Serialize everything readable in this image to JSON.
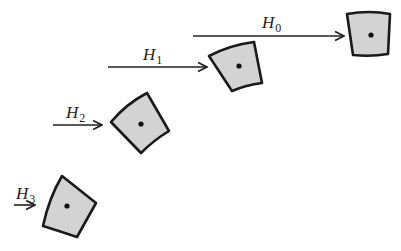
{
  "diagram": {
    "type": "sequence of rotating cells with field arrows",
    "colors": {
      "shape_fill": "#d3d3d3",
      "shape_stroke": "#1a1a1a",
      "arrow": "#222222",
      "background": "#ffffff"
    },
    "items": [
      {
        "label_main": "H",
        "label_sub": "0",
        "arrow": {
          "x1": 193,
          "x2": 344,
          "y": 36
        },
        "label_pos": {
          "x": 262,
          "y": 28
        },
        "shape_path": "M347,14 Q369,10 390,14 L388,54 Q371,57 353,55 Z",
        "center": {
          "x": 371,
          "y": 35
        }
      },
      {
        "label_main": "H",
        "label_sub": "1",
        "arrow": {
          "x1": 108,
          "x2": 207,
          "y": 67
        },
        "label_pos": {
          "x": 143,
          "y": 60
        },
        "shape_path": "M209,56 Q230,45 254,42 L262,83 Q246,85 232,91 Z",
        "center": {
          "x": 239,
          "y": 66
        }
      },
      {
        "label_main": "H",
        "label_sub": "2",
        "arrow": {
          "x1": 53,
          "x2": 102,
          "y": 125
        },
        "label_pos": {
          "x": 66,
          "y": 118
        },
        "shape_path": "M111,122 Q126,104 147,93 L169,131 Q154,140 141,153 Z",
        "center": {
          "x": 141,
          "y": 124
        }
      },
      {
        "label_main": "H",
        "label_sub": "3",
        "arrow": {
          "x1": 14,
          "x2": 35,
          "y": 205
        },
        "label_pos": {
          "x": 16,
          "y": 199
        },
        "shape_path": "M62,176 L96,203 L77,237 Q59,231 43,226 Q49,198 62,176 Z",
        "center": {
          "x": 67,
          "y": 206
        }
      }
    ]
  }
}
